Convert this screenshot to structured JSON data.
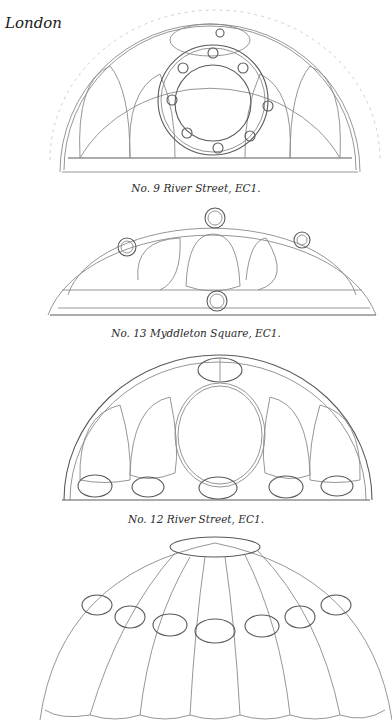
{
  "page": {
    "running_head": "London"
  },
  "figures": [
    {
      "id": "fanlight-1",
      "caption": "No. 9 River Street, EC1."
    },
    {
      "id": "fanlight-2",
      "caption": "No. 13 Myddleton Square, EC1."
    },
    {
      "id": "fanlight-3",
      "caption": "No. 12 River Street, EC1."
    },
    {
      "id": "fanlight-4",
      "caption": ""
    }
  ],
  "colors": {
    "ink": "#1a1a1a",
    "pencil": "#8a8a8a",
    "paper": "#ffffff"
  }
}
